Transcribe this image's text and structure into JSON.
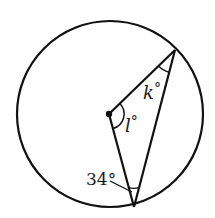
{
  "diagram": {
    "type": "circle-geometry",
    "circle": {
      "cx": 110,
      "cy": 114,
      "r": 93
    },
    "center_point": {
      "x": 109,
      "y": 114
    },
    "vertices": {
      "top_right": {
        "x": 175,
        "y": 50
      },
      "bottom": {
        "x": 134,
        "y": 207
      }
    },
    "labels": {
      "k": {
        "text": "k",
        "degree": "°",
        "x": 143,
        "y": 98
      },
      "l": {
        "text": "l",
        "degree": "°",
        "x": 125,
        "y": 131
      },
      "angle_34": {
        "text": "34°",
        "x": 86,
        "y": 185
      }
    },
    "colors": {
      "stroke": "#111111",
      "background": "#ffffff"
    }
  }
}
